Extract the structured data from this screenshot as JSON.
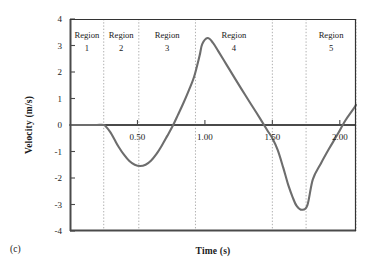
{
  "figure": {
    "panel_label": "(c)",
    "background": "#ffffff"
  },
  "chart_data": {
    "type": "line",
    "title": "",
    "xlabel": "Time (s)",
    "ylabel": "Velocity (m/s)",
    "xlim": [
      0.0,
      2.12
    ],
    "ylim": [
      -4,
      4
    ],
    "grid": false,
    "legend": "none",
    "line_color": "#6d6d6d",
    "axis_color": "#4a4a4a",
    "divider_color": "#b0b0b0",
    "xticks": [
      0.5,
      1.0,
      1.5,
      2.0
    ],
    "xtick_labels": [
      "0.50",
      "1.00",
      "1.50",
      "2.00"
    ],
    "yticks": [
      4,
      3,
      2,
      1,
      0,
      -1,
      -2,
      -3,
      -4
    ],
    "ytick_labels": [
      "4",
      "3",
      "2",
      "1",
      "0",
      "-1",
      "-2",
      "-3",
      "-4"
    ],
    "region_boundaries": [
      0.0,
      0.25,
      0.51,
      0.93,
      1.5,
      1.75,
      2.12
    ],
    "regions": [
      {
        "label_line1": "Region",
        "label_line2": "1",
        "x_center": 0.125
      },
      {
        "label_line1": "Region",
        "label_line2": "2",
        "x_center": 0.38
      },
      {
        "label_line1": "Region",
        "label_line2": "3",
        "x_center": 0.72
      },
      {
        "label_line1": "Region",
        "label_line2": "4",
        "x_center": 1.215
      },
      {
        "label_line1": "Region",
        "label_line2": "5",
        "x_center": 1.935
      }
    ],
    "annotations": [
      {
        "text": "minimum",
        "x": 0.58,
        "y": -1.55
      },
      {
        "text": "maximum",
        "x": 0.98,
        "y": 3.3
      },
      {
        "text": "minimum",
        "x": 1.59,
        "y": -3.2
      }
    ],
    "x": [
      0.0,
      0.05,
      0.1,
      0.15,
      0.2,
      0.25,
      0.27,
      0.3,
      0.33,
      0.36,
      0.4,
      0.44,
      0.48,
      0.52,
      0.56,
      0.6,
      0.64,
      0.68,
      0.72,
      0.76,
      0.8,
      0.84,
      0.88,
      0.92,
      0.96,
      0.98,
      1.02,
      1.06,
      1.1,
      1.16,
      1.22,
      1.3,
      1.38,
      1.46,
      1.5,
      1.54,
      1.58,
      1.6,
      1.62,
      1.65,
      1.68,
      1.72,
      1.76,
      1.8,
      1.86,
      1.92,
      1.98,
      2.04,
      2.1,
      2.12
    ],
    "y": [
      0.0,
      0.0,
      0.0,
      0.0,
      0.0,
      0.0,
      -0.08,
      -0.28,
      -0.55,
      -0.82,
      -1.12,
      -1.36,
      -1.5,
      -1.55,
      -1.5,
      -1.35,
      -1.1,
      -0.78,
      -0.42,
      -0.05,
      0.38,
      0.82,
      1.3,
      1.82,
      2.6,
      3.05,
      3.28,
      3.1,
      2.78,
      2.28,
      1.78,
      1.12,
      0.48,
      -0.18,
      -0.5,
      -0.95,
      -1.6,
      -1.95,
      -2.3,
      -2.72,
      -3.05,
      -3.2,
      -3.02,
      -2.05,
      -1.45,
      -0.9,
      -0.38,
      0.16,
      0.6,
      0.76
    ]
  }
}
